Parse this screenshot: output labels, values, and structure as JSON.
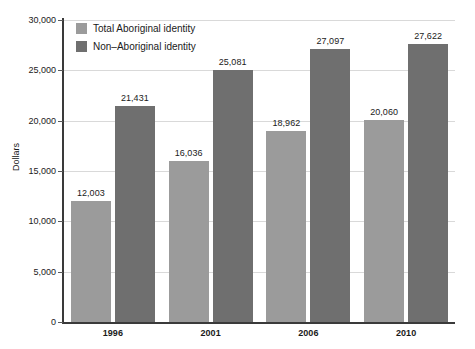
{
  "chart_data": {
    "type": "bar",
    "title": "",
    "xlabel": "",
    "ylabel": "Dollars",
    "categories": [
      "1996",
      "2001",
      "2006",
      "2010"
    ],
    "series": [
      {
        "name": "Total Aboriginal identity",
        "color": "#9b9b9b",
        "values": [
          12003,
          16036,
          18962,
          20060
        ],
        "labels": [
          "12,003",
          "16,036",
          "18,962",
          "20,060"
        ]
      },
      {
        "name": "Non–Aboriginal identity",
        "color": "#6f6f6f",
        "values": [
          21431,
          25081,
          27097,
          27622
        ],
        "labels": [
          "21,431",
          "25,081",
          "27,097",
          "27,622"
        ]
      }
    ],
    "ylim": [
      0,
      30000
    ],
    "yticks": [
      0,
      5000,
      10000,
      15000,
      20000,
      25000,
      30000
    ],
    "ytick_labels": [
      "0",
      "5,000",
      "10,000",
      "15,000",
      "20,000",
      "25,000",
      "30,000"
    ],
    "grid": true,
    "legend_position": "top-left"
  }
}
